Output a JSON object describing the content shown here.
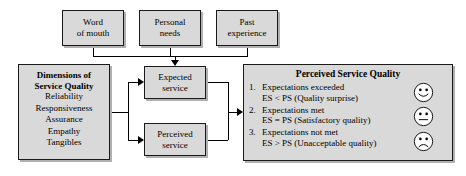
{
  "diagram": {
    "top_boxes": [
      {
        "line1": "Word",
        "line2": "of mouth"
      },
      {
        "line1": "Personal",
        "line2": "needs"
      },
      {
        "line1": "Past",
        "line2": "experience"
      }
    ],
    "dimensions_box": {
      "heading_line1": "Dimensions of",
      "heading_line2": "Service Quality",
      "items": [
        "Reliability",
        "Responsiveness",
        "Assurance",
        "Empathy",
        "Tangibles"
      ]
    },
    "service_boxes": [
      {
        "line1": "Expected",
        "line2": "service"
      },
      {
        "line1": "Perceived",
        "line2": "service"
      }
    ],
    "perceived_panel": {
      "title": "Perceived Service Quality",
      "items": [
        {
          "number": "1.",
          "line1": "Expectations exceeded",
          "line2": "ES < PS (Quality surprise)",
          "face": "happy-face-icon"
        },
        {
          "number": "2.",
          "line1": "Expectations met",
          "line2": "ES = PS (Satisfactory quality)",
          "face": "neutral-face-icon"
        },
        {
          "number": "3.",
          "line1": "Expectations not met",
          "line2": "ES > PS (Unacceptable quality)",
          "face": "sad-face-icon"
        }
      ]
    },
    "colors": {
      "box_fill": "#d9d9d9",
      "box_border": "#1a1a1a",
      "box_shadow": "#b0b0b0",
      "line": "#000000",
      "background": "#ffffff"
    }
  }
}
